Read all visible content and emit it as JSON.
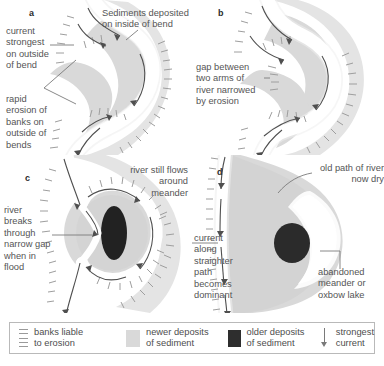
{
  "figure": {
    "caption": "",
    "colors": {
      "newer_deposit": "#d9d9d9",
      "older_deposit": "#2e2e2e",
      "channel_water": "#fdfdfd",
      "bank_tick": "#9a9a9a",
      "current_arrow": "#4f4f4f",
      "text": "#555555"
    }
  },
  "panels": [
    {
      "id": "a",
      "letter": "a",
      "annotations": [
        {
          "name": "current-strongest-label",
          "text": "current\nstrongest\non outside\nof bend"
        },
        {
          "name": "sediments-deposited-label",
          "text": "Sediments deposited\non inside of bend"
        },
        {
          "name": "rapid-erosion-label",
          "text": "rapid\nerosion of\nbanks on\noutside of\nbends"
        }
      ]
    },
    {
      "id": "b",
      "letter": "b",
      "annotations": [
        {
          "name": "gap-between-arms-label",
          "text": "gap between\ntwo arms of\nriver narrowed\nby erosion"
        }
      ]
    },
    {
      "id": "c",
      "letter": "c",
      "annotations": [
        {
          "name": "river-still-flows-label",
          "text": "river still flows\naround\nmeander"
        },
        {
          "name": "river-breaks-through-label",
          "text": "river\nbreaks\nthrough\nnarrow gap\nwhen in\nflood"
        }
      ]
    },
    {
      "id": "d",
      "letter": "d",
      "annotations": [
        {
          "name": "old-path-label",
          "text": "old path of river\nnow dry"
        },
        {
          "name": "current-straighter-path-label",
          "text": "current\nalong\nstraighter\npath\nbecomes\ndominant"
        },
        {
          "name": "abandoned-meander-label",
          "text": "abandoned\nmeander or\noxbow lake"
        }
      ]
    }
  ],
  "legend": {
    "items": [
      {
        "name": "banks-liable-to-erosion",
        "swatch": "dashes-icon",
        "text": "banks liable\nto erosion"
      },
      {
        "name": "newer-deposits",
        "swatch": "light-grey-square-icon",
        "text": "newer deposits\nof sediment"
      },
      {
        "name": "older-deposits",
        "swatch": "dark-grey-square-icon",
        "text": "older deposits\nof sediment"
      },
      {
        "name": "strongest-current",
        "swatch": "down-arrow-icon",
        "text": "strongest\ncurrent"
      }
    ]
  }
}
